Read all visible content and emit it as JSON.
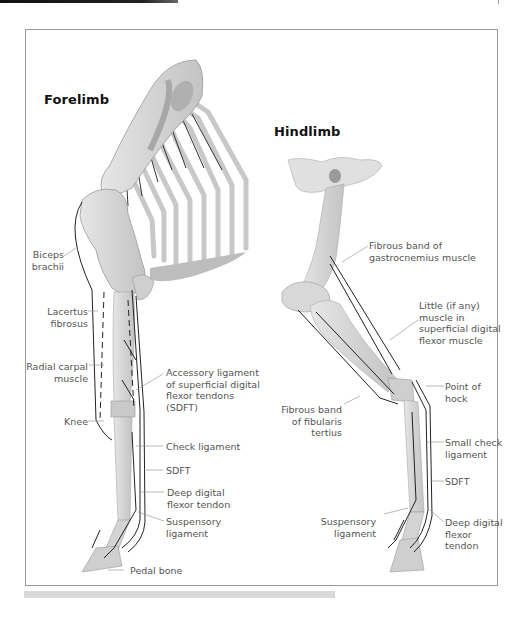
{
  "figure": {
    "forelimb": {
      "title": "Forelimb",
      "labels": {
        "biceps_brachii": "Biceps\nbrachii",
        "lacertus_fibrosus": "Lacertus\nfibrosus",
        "radial_carpal_muscle": "Radial carpal\nmuscle",
        "knee": "Knee",
        "accessory_ligament": "Accessory ligament\nof superficial digital\nflexor tendons\n(SDFT)",
        "check_ligament": "Check ligament",
        "sdft": "SDFT",
        "deep_digital_flexor_tendon": "Deep digital\nflexor tendon",
        "suspensory_ligament": "Suspensory\nligament",
        "pedal_bone": "Pedal bone"
      }
    },
    "hindlimb": {
      "title": "Hindlimb",
      "labels": {
        "fibrous_band_gastrocnemius": "Fibrous band of\ngastrocnemius muscle",
        "little_muscle": "Little (if any)\nmuscle in\nsuperficial digital\nflexor muscle",
        "point_of_hock": "Point of\nhock",
        "fibrous_band_fibularis": "Fibrous band\nof fibularis\ntertius",
        "small_check_ligament": "Small check\nligament",
        "sdft": "SDFT",
        "suspensory_ligament": "Suspensory\nligament",
        "deep_digital_flexor_tendon": "Deep digital\nflexor\ntendon"
      }
    },
    "colors": {
      "bone": "#dcdcdc",
      "bone_shade": "#b8b8b8",
      "tendon": "#222222",
      "leader": "#888888",
      "frame": "#9a9a9a",
      "label": "#555555"
    }
  }
}
